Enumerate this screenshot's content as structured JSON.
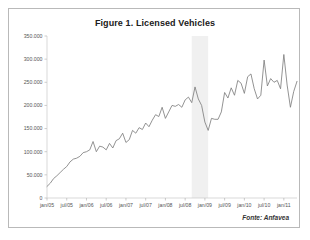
{
  "figure": {
    "title": "Figure 1. Licensed Vehicles",
    "source_note": "Fonte: Anfavea"
  },
  "chart_data": {
    "type": "line",
    "title": "Figure 1. Licensed Vehicles",
    "xlabel": "",
    "ylabel": "",
    "ylim": [
      0,
      350000
    ],
    "yticks": [
      0,
      50000,
      100000,
      150000,
      200000,
      250000,
      300000,
      350000
    ],
    "ytick_labels": [
      "0",
      "50.000",
      "100.000",
      "150.000",
      "200.000",
      "250.000",
      "300.000",
      "350.000"
    ],
    "xtick_labels": [
      "jan/05",
      "jul/05",
      "jan/06",
      "jul/06",
      "jan/07",
      "jul/07",
      "jan/08",
      "jul/08",
      "jan/09",
      "jul/09",
      "jan/10",
      "jul/10",
      "jan/11"
    ],
    "xtick_indices": [
      0,
      6,
      12,
      18,
      24,
      30,
      36,
      42,
      48,
      54,
      60,
      66,
      72
    ],
    "grid": false,
    "legend": null,
    "line_color": "#808080",
    "shaded_band": {
      "label": "",
      "color": "#f0f0f0",
      "start_index": 44,
      "end_index": 49
    },
    "x": [
      "jan/05",
      "fev/05",
      "mar/05",
      "abr/05",
      "mai/05",
      "jun/05",
      "jul/05",
      "ago/05",
      "set/05",
      "out/05",
      "nov/05",
      "dez/05",
      "jan/06",
      "fev/06",
      "mar/06",
      "abr/06",
      "mai/06",
      "jun/06",
      "jul/06",
      "ago/06",
      "set/06",
      "out/06",
      "nov/06",
      "dez/06",
      "jan/07",
      "fev/07",
      "mar/07",
      "abr/07",
      "mai/07",
      "jun/07",
      "jul/07",
      "ago/07",
      "set/07",
      "out/07",
      "nov/07",
      "dez/07",
      "jan/08",
      "fev/08",
      "mar/08",
      "abr/08",
      "mai/08",
      "jun/08",
      "jul/08",
      "ago/08",
      "set/08",
      "out/08",
      "nov/08",
      "dez/08",
      "jan/09",
      "fev/09",
      "mar/09",
      "abr/09",
      "mai/09",
      "jun/09",
      "jul/09",
      "ago/09",
      "set/09",
      "out/09",
      "nov/09",
      "dez/09",
      "jan/10",
      "fev/10",
      "mar/10",
      "abr/10",
      "mai/10",
      "jun/10",
      "jul/10",
      "ago/10",
      "set/10",
      "out/10",
      "nov/10",
      "dez/10",
      "jan/11",
      "fev/11",
      "mar/11",
      "abr/11",
      "mai/11"
    ],
    "values": [
      25000,
      32000,
      42000,
      48000,
      55000,
      62000,
      68000,
      78000,
      84000,
      86000,
      90000,
      98000,
      100000,
      104000,
      122000,
      100000,
      112000,
      110000,
      104000,
      118000,
      108000,
      124000,
      128000,
      140000,
      120000,
      126000,
      146000,
      140000,
      152000,
      148000,
      162000,
      154000,
      168000,
      180000,
      176000,
      196000,
      172000,
      186000,
      200000,
      198000,
      202000,
      196000,
      212000,
      218000,
      206000,
      240000,
      214000,
      200000,
      164000,
      146000,
      172000,
      170000,
      170000,
      186000,
      228000,
      216000,
      238000,
      222000,
      254000,
      248000,
      226000,
      262000,
      268000,
      236000,
      214000,
      222000,
      298000,
      242000,
      258000,
      250000,
      254000,
      236000,
      310000,
      244000,
      196000,
      230000,
      252000
    ]
  }
}
